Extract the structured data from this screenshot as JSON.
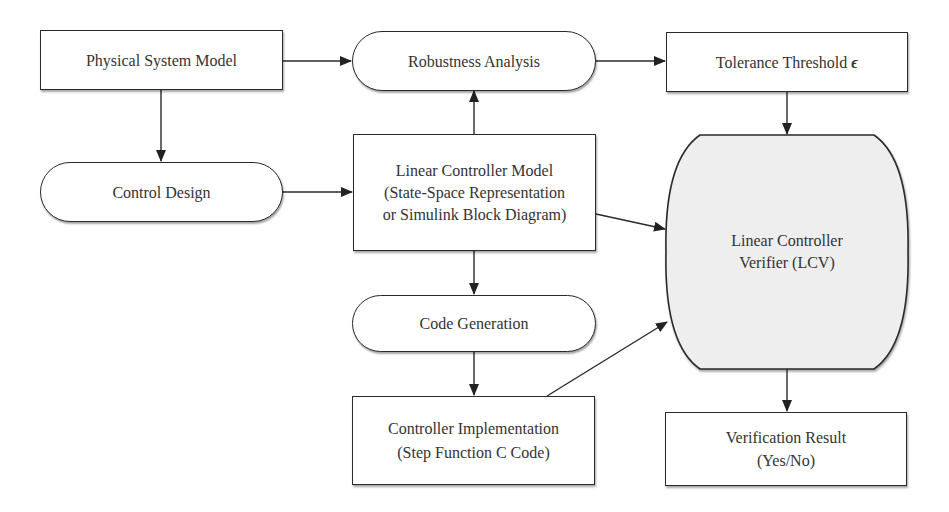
{
  "diagram": {
    "type": "flowchart",
    "nodes": {
      "physical_system_model": {
        "shape": "rectangle",
        "lines": [
          "Physical System Model"
        ]
      },
      "robustness_analysis": {
        "shape": "rounded",
        "lines": [
          "Robustness Analysis"
        ]
      },
      "tolerance_threshold": {
        "shape": "rectangle",
        "label": "Tolerance Threshold",
        "symbol": "ϵ"
      },
      "control_design": {
        "shape": "rounded",
        "lines": [
          "Control Design"
        ]
      },
      "linear_controller_model": {
        "shape": "rectangle",
        "lines": [
          "Linear Controller Model",
          "(State-Space Representation",
          "or Simulink Block Diagram)"
        ]
      },
      "lcv": {
        "shape": "stored-data",
        "fill": "#eeeeee",
        "lines": [
          "Linear Controller",
          "Verifier (LCV)"
        ]
      },
      "code_generation": {
        "shape": "rounded",
        "lines": [
          "Code Generation"
        ]
      },
      "controller_implementation": {
        "shape": "rectangle",
        "lines": [
          "Controller Implementation",
          "(Step Function C Code)"
        ]
      },
      "verification_result": {
        "shape": "rectangle",
        "lines": [
          "Verification Result",
          "(Yes/No)"
        ]
      }
    },
    "edges": [
      {
        "from": "physical_system_model",
        "to": "robustness_analysis"
      },
      {
        "from": "physical_system_model",
        "to": "control_design"
      },
      {
        "from": "robustness_analysis",
        "to": "tolerance_threshold"
      },
      {
        "from": "linear_controller_model",
        "to": "robustness_analysis"
      },
      {
        "from": "control_design",
        "to": "linear_controller_model"
      },
      {
        "from": "tolerance_threshold",
        "to": "lcv"
      },
      {
        "from": "linear_controller_model",
        "to": "lcv"
      },
      {
        "from": "linear_controller_model",
        "to": "code_generation"
      },
      {
        "from": "code_generation",
        "to": "controller_implementation"
      },
      {
        "from": "controller_implementation",
        "to": "lcv"
      },
      {
        "from": "lcv",
        "to": "verification_result"
      }
    ]
  }
}
